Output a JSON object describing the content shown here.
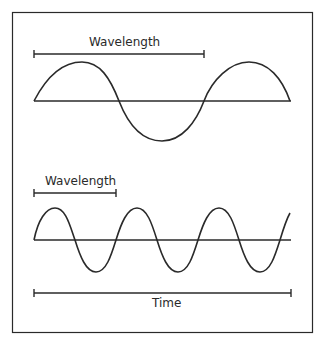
{
  "diagram": {
    "colors": {
      "stroke": "#2a2a2a",
      "background": "#ffffff"
    },
    "top_panel": {
      "wavelength_label": "Wavelength",
      "description": "Long-wavelength sine wave, about 1.5 cycles shown"
    },
    "bottom_panel": {
      "wavelength_label": "Wavelength",
      "description": "Short-wavelength sine wave, about 3 cycles shown"
    },
    "time_axis": {
      "label": "Time"
    }
  }
}
